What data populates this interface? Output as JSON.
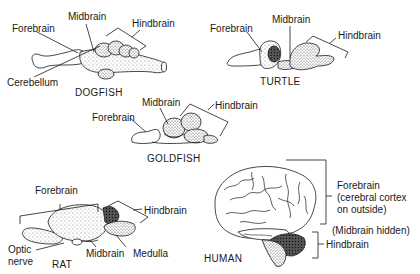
{
  "diagram": {
    "animals": [
      {
        "name": "DOGFISH",
        "labels": [
          "Forebrain",
          "Midbrain",
          "Hindbrain",
          "Cerebellum"
        ]
      },
      {
        "name": "TURTLE",
        "labels": [
          "Forebrain",
          "Midbrain",
          "Hindbrain"
        ]
      },
      {
        "name": "GOLDFISH",
        "labels": [
          "Forebrain",
          "Midbrain",
          "Hindbrain"
        ]
      },
      {
        "name": "RAT",
        "labels": [
          "Forebrain",
          "Hindbrain",
          "Optic nerve",
          "Midbrain",
          "Medulla"
        ]
      },
      {
        "name": "HUMAN",
        "labels": [
          "Forebrain (cerebral cortex on outside)",
          "(Midbrain hidden)",
          "Hindbrain"
        ]
      }
    ]
  },
  "dogfish": {
    "name": "DOGFISH",
    "forebrain": "Forebrain",
    "midbrain": "Midbrain",
    "hindbrain": "Hindbrain",
    "cerebellum": "Cerebellum"
  },
  "turtle": {
    "name": "TURTLE",
    "forebrain": "Forebrain",
    "midbrain": "Midbrain",
    "hindbrain": "Hindbrain"
  },
  "goldfish": {
    "name": "GOLDFISH",
    "forebrain": "Forebrain",
    "midbrain": "Midbrain",
    "hindbrain": "Hindbrain"
  },
  "rat": {
    "name": "RAT",
    "forebrain": "Forebrain",
    "hindbrain": "Hindbrain",
    "optic_nerve_1": "Optic",
    "optic_nerve_2": "nerve",
    "midbrain": "Midbrain",
    "medulla": "Medulla"
  },
  "human": {
    "name": "HUMAN",
    "forebrain_1": "Forebrain",
    "forebrain_2": "(cerebral cortex",
    "forebrain_3": "on outside)",
    "midbrain_hidden": "(Midbrain hidden)",
    "hindbrain": "Hindbrain"
  },
  "colors": {
    "ink": "#1a1a1a",
    "stipple": "#555555",
    "background": "#ffffff"
  }
}
